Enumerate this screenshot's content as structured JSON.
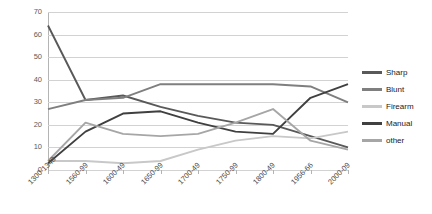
{
  "chart_data": {
    "type": "line",
    "title": "",
    "xlabel": "",
    "ylabel": "",
    "ylim": [
      0,
      70
    ],
    "ytick_step": 10,
    "grid": true,
    "legend_position": "right",
    "categories": [
      "1300-1348",
      "1560-99",
      "1600-49",
      "1650-99",
      "1700-49",
      "1750-99",
      "1800-49",
      "1956-66",
      "2000-09"
    ],
    "yticks": [
      "0",
      "10",
      "20",
      "30",
      "40",
      "50",
      "60",
      "70"
    ],
    "series": [
      {
        "name": "Sharp",
        "color": "#595959",
        "values": [
          64,
          31,
          33,
          28,
          24,
          21,
          20,
          15,
          10
        ]
      },
      {
        "name": "Blunt",
        "color": "#7f7f7f",
        "values": [
          27,
          31,
          32,
          38,
          38,
          38,
          38,
          37,
          30
        ]
      },
      {
        "name": "Firearm",
        "color": "#c8c8c8",
        "values": [
          4,
          4,
          3,
          4,
          9,
          13,
          15,
          14,
          17
        ]
      },
      {
        "name": "Manual",
        "color": "#404040",
        "values": [
          3,
          17,
          25,
          26,
          21,
          17,
          16,
          32,
          38
        ]
      },
      {
        "name": "other",
        "color": "#a6a6a6",
        "values": [
          4,
          21,
          16,
          15,
          16,
          21,
          27,
          13,
          9
        ]
      }
    ]
  },
  "legend": {
    "items": [
      {
        "label": "Sharp"
      },
      {
        "label": "Blunt"
      },
      {
        "label": "Firearm"
      },
      {
        "label": "Manual"
      },
      {
        "label": "other"
      }
    ]
  }
}
